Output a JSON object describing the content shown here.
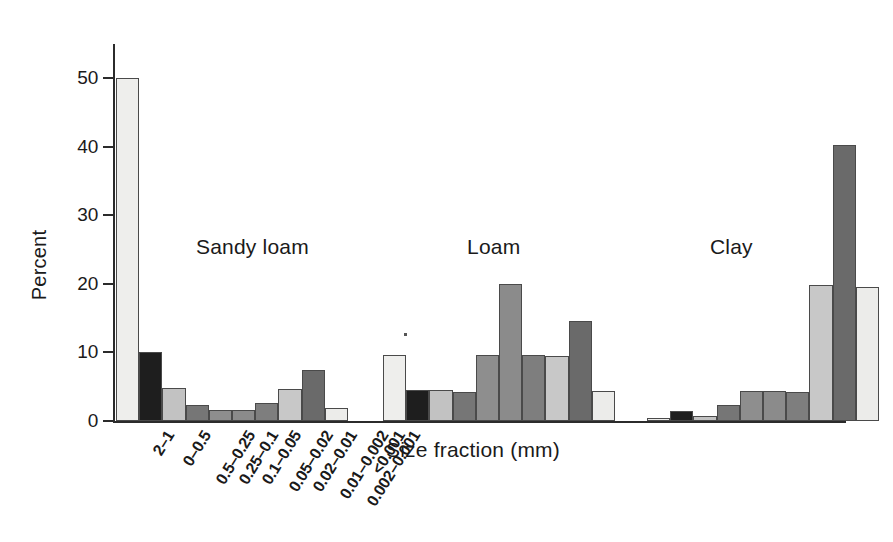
{
  "chart_data": {
    "type": "bar",
    "title": "",
    "xlabel": "Size fraction (mm)",
    "ylabel": "Percent",
    "ylim": [
      0,
      55
    ],
    "yticks": [
      0,
      10,
      20,
      30,
      40,
      50
    ],
    "ytick_labels": [
      "0",
      "10",
      "20",
      "30",
      "40",
      "50"
    ],
    "grid": false,
    "legend": "none",
    "categories": [
      "2–1",
      "0–0.5",
      "0.5–0.25",
      "0.25–0.1",
      "0.1–0.05",
      "0.05–0.02",
      "0.02–0.01",
      "0.01–0.002",
      "0.002–0.001",
      "<0.001"
    ],
    "groups": [
      {
        "name": "Sandy loam",
        "values": [
          50.0,
          10.0,
          4.8,
          2.4,
          1.6,
          1.6,
          2.6,
          4.6,
          7.4,
          1.9
        ]
      },
      {
        "name": "Loam",
        "values": [
          9.7,
          4.5,
          4.5,
          4.3,
          9.7,
          20.0,
          9.7,
          9.5,
          14.6,
          4.4
        ]
      },
      {
        "name": "Clay",
        "values": [
          0.4,
          1.5,
          0.7,
          2.4,
          4.4,
          4.4,
          4.3,
          19.8,
          40.2,
          19.6
        ]
      }
    ],
    "bar_colors": [
      "#eeeeec",
      "#1e1e1e",
      "#c2c2c2",
      "#767676",
      "#8e8e8e",
      "#8b8b8b",
      "#7e7e7e",
      "#c8c8c8",
      "#6a6a6a",
      "#ececea"
    ]
  },
  "axes": {
    "y_title": "Percent",
    "x_title": "Size fraction (mm)"
  }
}
